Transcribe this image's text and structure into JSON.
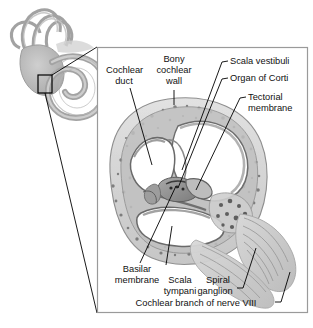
{
  "figure": {
    "background_color": "#ffffff",
    "panel": {
      "border_color": "#9a9a9a",
      "fill_color": "#ffffff",
      "x": 97,
      "y": 47,
      "width": 211,
      "height": 266
    },
    "inset": {
      "name": "bony-labyrinth-inset",
      "description": "Semicircular canals, vestibule and spiral cochlea shown in gray",
      "selection_box": {
        "x": 38,
        "y": 75,
        "width": 14,
        "height": 18,
        "stroke": "#000000"
      }
    },
    "palette": {
      "bone": "#d6d6d6",
      "bone_dark": "#b4b4b4",
      "speckle": "#6f6f6f",
      "membrane": "#9a9a9a",
      "membrane_dark": "#6a6a6a",
      "lumen": "#ffffff",
      "nerve": "#c9c9c9",
      "leader_line": "#000000",
      "inset_gray": "#b9b9b9"
    }
  },
  "labels": {
    "cochlear_duct": {
      "line1": "Cochlear",
      "line2": "duct"
    },
    "bony_cochlear_wall": {
      "line1": "Bony",
      "line2": "cochlear",
      "line3": "wall"
    },
    "scala_vestibuli": {
      "line1": "Scala vestibuli"
    },
    "organ_of_corti": {
      "line1": "Organ of Corti"
    },
    "tectorial_membrane": {
      "line1": "Tectorial",
      "line2": "membrane"
    },
    "basilar_membrane": {
      "line1": "Basilar",
      "line2": "membrane"
    },
    "scala_tympani": {
      "line1": "Scala",
      "line2": "tympani"
    },
    "spiral_ganglion": {
      "line1": "Spiral",
      "line2": "ganglion"
    },
    "cochlear_branch": {
      "line1": "Cochlear branch of nerve VIII"
    }
  }
}
